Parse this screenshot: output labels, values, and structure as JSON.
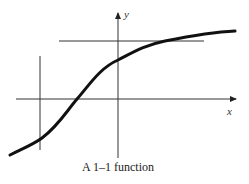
{
  "caption": "A 1–1 function",
  "axes": {
    "x_label": "x",
    "y_label": "y"
  },
  "diagram": {
    "type": "function graph",
    "curve": "increasing S-shaped (sigmoid-like) curve",
    "lines": [
      {
        "kind": "horizontal",
        "description": "horizontal line intersecting curve once"
      },
      {
        "kind": "vertical",
        "description": "vertical line intersecting curve once"
      }
    ],
    "colors": {
      "curve": "#111111",
      "lines": "#333333"
    }
  }
}
